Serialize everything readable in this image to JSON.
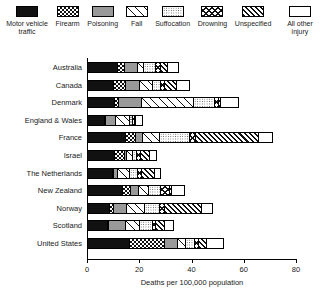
{
  "legend": {
    "items": [
      {
        "label": "Motor vehicle traffic",
        "key": "motor",
        "pattern": "solid-black"
      },
      {
        "label": "Firearm",
        "key": "firearm",
        "pattern": "checkerboard"
      },
      {
        "label": "Poisoning",
        "key": "poisoning",
        "pattern": "solid-gray"
      },
      {
        "label": "Fall",
        "key": "fall",
        "pattern": "sparse-diagonal"
      },
      {
        "label": "Suffocation",
        "key": "suffocation",
        "pattern": "stipple-dots"
      },
      {
        "label": "Drowning",
        "key": "drowning",
        "pattern": "cross-hatch"
      },
      {
        "label": "Unspecified",
        "key": "unspecified",
        "pattern": "dense-diagonal"
      },
      {
        "label": "All other injury",
        "key": "other",
        "pattern": "white"
      }
    ]
  },
  "chart_data": {
    "type": "bar",
    "orientation": "horizontal",
    "stacked": true,
    "title": "",
    "xlabel": "Deaths per 100,000 population",
    "ylabel": "",
    "xlim": [
      0,
      80
    ],
    "xticks": [
      0,
      20,
      40,
      60,
      80
    ],
    "xticklabels": [
      "0",
      "20",
      "40",
      "60",
      "80"
    ],
    "grid": false,
    "legend_position": "top",
    "categories": [
      "Australia",
      "Canada",
      "Denmark",
      "England & Wales",
      "France",
      "Israel",
      "The Netherlands",
      "New Zealand",
      "Norway",
      "Scotland",
      "United States"
    ],
    "series": [
      {
        "name": "Motor vehicle traffic",
        "key": "motor",
        "values": [
          11.5,
          10.0,
          10.5,
          6.5,
          14.5,
          10.5,
          9.5,
          13.5,
          8.5,
          7.5,
          16.0
        ]
      },
      {
        "name": "Firearm",
        "key": "firearm",
        "values": [
          2.5,
          4.5,
          1.5,
          0.4,
          4.0,
          3.5,
          0.6,
          3.0,
          1.5,
          0.5,
          13.5
        ]
      },
      {
        "name": "Poisoning",
        "key": "poisoning",
        "values": [
          5.0,
          5.5,
          8.5,
          4.0,
          2.5,
          0.8,
          1.5,
          3.0,
          5.0,
          6.5,
          5.0
        ]
      },
      {
        "name": "Fall",
        "key": "fall",
        "values": [
          2.5,
          5.0,
          20.0,
          5.0,
          6.5,
          2.5,
          4.5,
          4.0,
          7.0,
          5.5,
          3.0
        ]
      },
      {
        "name": "Suffocation",
        "key": "suffocation",
        "values": [
          4.5,
          3.0,
          8.0,
          1.5,
          11.5,
          1.5,
          3.0,
          4.5,
          5.5,
          5.0,
          3.5
        ]
      },
      {
        "name": "Drowning",
        "key": "drowning",
        "values": [
          2.0,
          1.5,
          1.5,
          0.6,
          2.5,
          1.5,
          1.5,
          3.5,
          2.0,
          1.0,
          1.5
        ]
      },
      {
        "name": "Unspecified",
        "key": "unspecified",
        "values": [
          2.5,
          4.5,
          1.0,
          0.5,
          24.0,
          3.5,
          5.0,
          0.5,
          14.0,
          3.5,
          3.0
        ]
      },
      {
        "name": "All other injury",
        "key": "other",
        "values": [
          4.5,
          5.0,
          7.0,
          2.5,
          5.5,
          2.5,
          2.5,
          5.0,
          4.5,
          3.5,
          6.5
        ]
      }
    ],
    "totals": [
      35.0,
      39.0,
      58.0,
      21.0,
      71.0,
      26.3,
      28.1,
      37.0,
      48.0,
      33.0,
      52.0
    ]
  }
}
